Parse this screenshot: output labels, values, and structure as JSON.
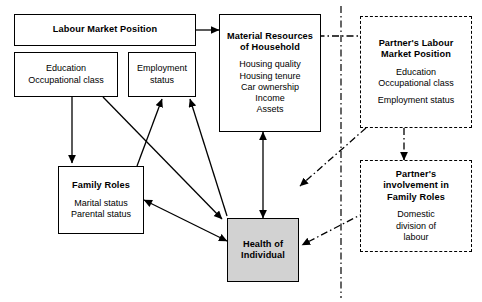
{
  "diagram": {
    "type": "path-diagram",
    "colors": {
      "outcome_fill": "#d2d2d2",
      "line": "#000000",
      "background": "#ffffff"
    }
  },
  "boxes": {
    "labour_market_position": {
      "title": "Labour Market Position",
      "border": "solid"
    },
    "education": {
      "items": [
        "Education",
        "Occupational class"
      ],
      "border": "solid"
    },
    "employment": {
      "items": [
        "Employment",
        "status"
      ],
      "border": "solid"
    },
    "material_resources": {
      "title_line1": "Material Resources",
      "title_line2": "of Household",
      "items": [
        "Housing quality",
        "Housing tenure",
        "Car ownership",
        "Income",
        "Assets"
      ],
      "border": "solid"
    },
    "family_roles": {
      "title": "Family Roles",
      "items": [
        "Marital status",
        "Parental status"
      ],
      "border": "solid"
    },
    "health_of_individual": {
      "title_line1": "Health of",
      "title_line2": "Individual",
      "border": "solid",
      "fill": "#d2d2d2"
    },
    "partner_labour_market_position": {
      "title_line1": "Partner's Labour",
      "title_line2": "Market Position",
      "items_group1": [
        "Education",
        "Occupational class"
      ],
      "items_group2": [
        "Employment status"
      ],
      "border": "dashed"
    },
    "partner_family_roles": {
      "title_line1": "Partner's",
      "title_line2": "involvement in",
      "title_line3": "Family Roles",
      "items": [
        "Domestic",
        "division of",
        "labour"
      ],
      "border": "dashed"
    }
  },
  "connections": [
    {
      "from": "labour_market_position",
      "to": "material_resources",
      "style": "solid",
      "heads": 1
    },
    {
      "from": "partner_labour_market_position",
      "to": "material_resources",
      "style": "dash-dot",
      "heads": 1
    },
    {
      "from": "education",
      "to": "family_roles",
      "style": "solid",
      "heads": 1
    },
    {
      "from": "education",
      "to": "health_of_individual",
      "style": "solid",
      "heads": 1
    },
    {
      "from": "family_roles",
      "to": "employment",
      "style": "solid",
      "heads": 1
    },
    {
      "from": "health_of_individual",
      "to": "employment",
      "style": "solid",
      "heads": 1
    },
    {
      "from": "material_resources",
      "to": "health_of_individual",
      "style": "solid",
      "heads": 2
    },
    {
      "from": "family_roles",
      "to": "health_of_individual",
      "style": "solid",
      "heads": 2
    },
    {
      "from": "partner_labour_market_position",
      "to": "partner_family_roles",
      "style": "dash-dot",
      "heads": 1
    },
    {
      "from": "partner_labour_market_position",
      "to": "health_of_individual",
      "style": "dash-dot",
      "heads": 1
    },
    {
      "from": "partner_family_roles",
      "to": "health_of_individual",
      "style": "dash-dot",
      "heads": 1
    }
  ],
  "divider": {
    "style": "dash-dot",
    "orientation": "vertical"
  }
}
